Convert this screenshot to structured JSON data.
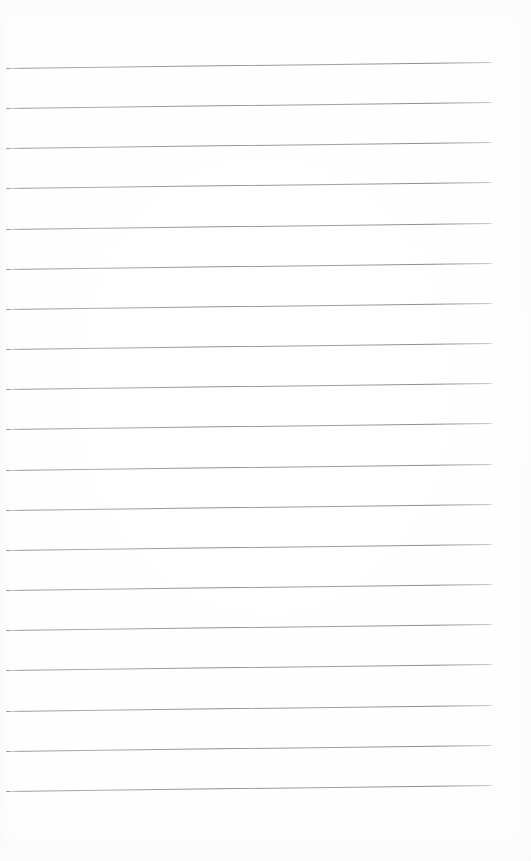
{
  "document": {
    "kind": "lined-notebook-page",
    "title": "Blank lined notebook page",
    "page_width": 531,
    "page_height": 861,
    "paper_color": "#ffffff",
    "rule_color": "#82848b",
    "has_margin_rule": false,
    "has_handwriting": false,
    "has_text": false,
    "body_text": "",
    "orientation": "portrait"
  },
  "layout": {
    "rule_left_x": 6,
    "rule_right_x": 493,
    "rule_length": 487,
    "rule_thickness_px": 1,
    "rule_skew_deg": -0.72,
    "first_rule_y": 68,
    "rule_spacing": 40.1,
    "rule_count": 19,
    "top_margin": 68,
    "bottom_margin": 71
  },
  "rules": [
    {
      "index": 1,
      "y": 68
    },
    {
      "index": 2,
      "y": 108
    },
    {
      "index": 3,
      "y": 148
    },
    {
      "index": 4,
      "y": 188
    },
    {
      "index": 5,
      "y": 229
    },
    {
      "index": 6,
      "y": 269
    },
    {
      "index": 7,
      "y": 309
    },
    {
      "index": 8,
      "y": 349
    },
    {
      "index": 9,
      "y": 389
    },
    {
      "index": 10,
      "y": 429
    },
    {
      "index": 11,
      "y": 470
    },
    {
      "index": 12,
      "y": 510
    },
    {
      "index": 13,
      "y": 550
    },
    {
      "index": 14,
      "y": 590
    },
    {
      "index": 15,
      "y": 630
    },
    {
      "index": 16,
      "y": 670
    },
    {
      "index": 17,
      "y": 711
    },
    {
      "index": 18,
      "y": 751
    },
    {
      "index": 19,
      "y": 791
    }
  ]
}
